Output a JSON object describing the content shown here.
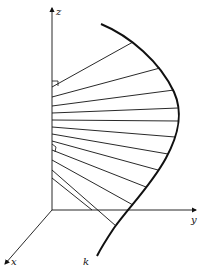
{
  "diagram": {
    "type": "3d-axes-with-space-curve",
    "axes": {
      "z": {
        "label": "z",
        "from": [
          52,
          210
        ],
        "to": [
          52,
          8
        ]
      },
      "y": {
        "label": "y",
        "from": [
          52,
          210
        ],
        "to": [
          196,
          210
        ]
      },
      "x": {
        "label": "x",
        "from": [
          52,
          210
        ],
        "to": [
          5,
          264
        ]
      }
    },
    "curve": {
      "label": "k",
      "path": "M101,24 C130,36 160,62 174,92 C184,114 178,136 166,158 C152,184 130,206 114,228 C106,240 100,250 97,256"
    },
    "labels": {
      "z": "z",
      "y": "y",
      "x": "x",
      "k": "k"
    },
    "rays": [
      {
        "from": [
          52,
          87
        ],
        "to": [
          133,
          42
        ]
      },
      {
        "from": [
          52,
          97
        ],
        "to": [
          160,
          68
        ]
      },
      {
        "from": [
          52,
          106
        ],
        "to": [
          174,
          90
        ]
      },
      {
        "from": [
          52,
          113
        ],
        "to": [
          178,
          108
        ]
      },
      {
        "from": [
          52,
          120
        ],
        "to": [
          178,
          121
        ]
      },
      {
        "from": [
          52,
          127
        ],
        "to": [
          175,
          137
        ]
      },
      {
        "from": [
          52,
          134
        ],
        "to": [
          168,
          154
        ]
      },
      {
        "from": [
          52,
          141
        ],
        "to": [
          158,
          170
        ]
      },
      {
        "from": [
          52,
          150
        ],
        "to": [
          146,
          187
        ]
      },
      {
        "from": [
          52,
          160
        ],
        "to": [
          133,
          205
        ]
      },
      {
        "from": [
          52,
          170
        ],
        "to": [
          116,
          226
        ]
      },
      {
        "from": [
          52,
          178
        ],
        "to": [
          92,
          210
        ]
      }
    ],
    "right_angle_markers": [
      {
        "at": [
          52,
          87
        ],
        "size": 6
      },
      {
        "at": [
          52,
          150
        ],
        "size": 5
      }
    ],
    "colors": {
      "stroke": "#111111",
      "background": "#ffffff"
    }
  }
}
